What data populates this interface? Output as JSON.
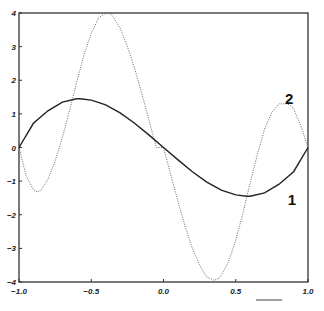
{
  "chart_data": {
    "type": "line",
    "title": "",
    "xlabel": "",
    "ylabel": "",
    "xlim": [
      -1.0,
      1.0
    ],
    "ylim": [
      -4,
      4
    ],
    "grid": false,
    "legend": "none (inline curve labels '1' and '2')",
    "x_ticks": [
      "-1.0",
      "-0.5",
      "0.0",
      "0.5",
      "1.0"
    ],
    "y_ticks": [
      "4",
      "3",
      "2",
      "1",
      "0",
      "-1",
      "-2",
      "-3",
      "-4"
    ],
    "series": [
      {
        "name": "1",
        "style": "solid",
        "color": "#222222",
        "label_position": {
          "x": 0.86,
          "y": -1.55
        },
        "x": [
          -1.0,
          -0.9,
          -0.8,
          -0.7,
          -0.6,
          -0.577,
          -0.5,
          -0.4,
          -0.3,
          -0.2,
          -0.1,
          0.0,
          0.1,
          0.2,
          0.3,
          0.4,
          0.5,
          0.577,
          0.6,
          0.7,
          0.8,
          0.9,
          1.0
        ],
        "values": [
          0.0,
          0.72,
          1.09,
          1.35,
          1.45,
          1.45,
          1.41,
          1.27,
          1.03,
          0.72,
          0.37,
          0.0,
          -0.37,
          -0.72,
          -1.03,
          -1.27,
          -1.41,
          -1.45,
          -1.45,
          -1.35,
          -1.09,
          -0.72,
          0.0
        ]
      },
      {
        "name": "2",
        "style": "dotted",
        "color": "#555555",
        "label_position": {
          "x": 0.84,
          "y": 1.45
        },
        "x": [
          -1.0,
          -0.95,
          -0.9,
          -0.875,
          -0.85,
          -0.8,
          -0.75,
          -0.7,
          -0.65,
          -0.6,
          -0.55,
          -0.5,
          -0.45,
          -0.4,
          -0.37,
          -0.35,
          -0.3,
          -0.25,
          -0.2,
          -0.15,
          -0.1,
          -0.05,
          0.0,
          0.05,
          0.1,
          0.15,
          0.2,
          0.25,
          0.3,
          0.35,
          0.38,
          0.4,
          0.45,
          0.5,
          0.55,
          0.6,
          0.65,
          0.7,
          0.75,
          0.8,
          0.85,
          0.88,
          0.9,
          0.95,
          1.0
        ],
        "values": [
          0.0,
          -0.85,
          -1.25,
          -1.32,
          -1.28,
          -0.95,
          -0.4,
          0.3,
          1.1,
          1.95,
          2.75,
          3.4,
          3.85,
          4.0,
          3.98,
          3.9,
          3.55,
          3.0,
          2.35,
          1.6,
          0.8,
          0.0,
          0.0,
          -0.8,
          -1.6,
          -2.35,
          -3.0,
          -3.5,
          -3.85,
          -3.95,
          -3.9,
          -3.8,
          -3.4,
          -2.75,
          -1.95,
          -1.05,
          -0.2,
          0.55,
          1.05,
          1.3,
          1.3,
          1.25,
          1.15,
          0.65,
          0.0
        ]
      }
    ]
  },
  "axes": {
    "x_tick_labels": [
      "-1.0",
      "-0.5",
      "0.0",
      "0.5",
      "1.0"
    ],
    "y_tick_labels": [
      "4",
      "3",
      "2",
      "1",
      "0",
      "-1",
      "-2",
      "-3",
      "-4"
    ]
  },
  "labels": {
    "curve1": "1",
    "curve2": "2"
  }
}
